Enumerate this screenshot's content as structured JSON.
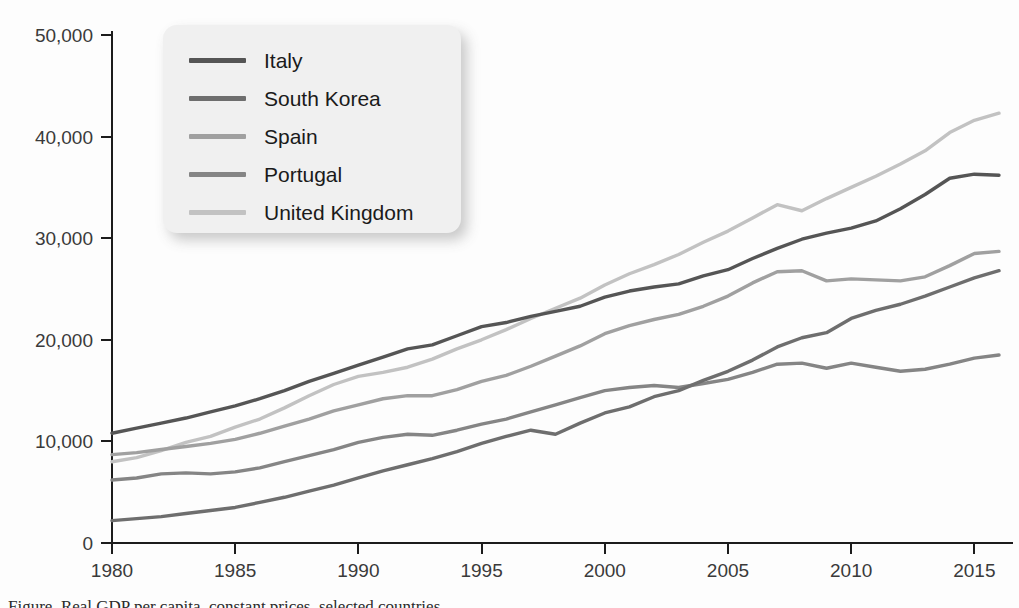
{
  "chart_data": {
    "type": "line",
    "title": "",
    "subtitle": "",
    "xlabel": "",
    "ylabel": "",
    "xlim": [
      1980,
      2016
    ],
    "ylim": [
      0,
      50000
    ],
    "grid": false,
    "legend_position": "top-left",
    "x_ticks": [
      "1980",
      "1985",
      "1990",
      "1995",
      "2000",
      "2005",
      "2010",
      "2015"
    ],
    "x_tick_values": [
      1980,
      1985,
      1990,
      1995,
      2000,
      2005,
      2010,
      2015
    ],
    "y_ticks": [
      "0",
      "10,000",
      "20,000",
      "30,000",
      "40,000",
      "50,000"
    ],
    "y_tick_values": [
      0,
      10000,
      20000,
      30000,
      40000,
      50000
    ],
    "x": [
      1980,
      1981,
      1982,
      1983,
      1984,
      1985,
      1986,
      1987,
      1988,
      1989,
      1990,
      1991,
      1992,
      1993,
      1994,
      1995,
      1996,
      1997,
      1998,
      1999,
      2000,
      2001,
      2002,
      2003,
      2004,
      2005,
      2006,
      2007,
      2008,
      2009,
      2010,
      2011,
      2012,
      2013,
      2014,
      2015,
      2016
    ],
    "series": [
      {
        "name": "Italy",
        "color": "#555555",
        "values": [
          10800,
          11300,
          11800,
          12300,
          12900,
          13500,
          14200,
          15000,
          15900,
          16700,
          17500,
          18300,
          19100,
          19500,
          20400,
          21300,
          21700,
          22300,
          22800,
          23300,
          24200,
          24800,
          25200,
          25500,
          26300,
          26900,
          28000,
          29000,
          29900,
          30500,
          31000,
          31700,
          32900,
          34300,
          35900,
          36300,
          36200
        ]
      },
      {
        "name": "South Korea",
        "color": "#6e6e6e",
        "values": [
          2200,
          2400,
          2600,
          2900,
          3200,
          3500,
          4000,
          4500,
          5100,
          5700,
          6400,
          7100,
          7700,
          8300,
          9000,
          9800,
          10500,
          11100,
          10700,
          11800,
          12800,
          13400,
          14400,
          15000,
          16000,
          16900,
          18000,
          19300,
          20200,
          20700,
          22100,
          22900,
          23500,
          24300,
          25200,
          26100,
          26800
        ]
      },
      {
        "name": "Spain",
        "color": "#a0a0a0",
        "values": [
          8700,
          8900,
          9200,
          9500,
          9800,
          10200,
          10800,
          11500,
          12200,
          13000,
          13600,
          14200,
          14500,
          14500,
          15100,
          15900,
          16500,
          17400,
          18400,
          19400,
          20600,
          21400,
          22000,
          22500,
          23300,
          24300,
          25600,
          26700,
          26800,
          25800,
          26000,
          25900,
          25800,
          26200,
          27300,
          28500,
          28700
        ]
      },
      {
        "name": "Portugal",
        "color": "#858585",
        "values": [
          6200,
          6400,
          6800,
          6900,
          6800,
          7000,
          7400,
          8000,
          8600,
          9200,
          9900,
          10400,
          10700,
          10600,
          11100,
          11700,
          12200,
          12900,
          13600,
          14300,
          15000,
          15300,
          15500,
          15300,
          15700,
          16100,
          16800,
          17600,
          17700,
          17200,
          17700,
          17300,
          16900,
          17100,
          17600,
          18200,
          18500
        ]
      },
      {
        "name": "United Kingdom",
        "color": "#c2c2c2",
        "values": [
          8000,
          8400,
          9100,
          9900,
          10500,
          11400,
          12200,
          13300,
          14500,
          15600,
          16400,
          16800,
          17300,
          18100,
          19100,
          20000,
          21000,
          22100,
          23100,
          24100,
          25400,
          26500,
          27400,
          28400,
          29600,
          30700,
          32000,
          33300,
          32700,
          33900,
          35000,
          36100,
          37300,
          38600,
          40400,
          41600,
          42300
        ]
      }
    ]
  },
  "legend": {
    "entries": [
      {
        "label": "Italy",
        "color": "#555555"
      },
      {
        "label": "South Korea",
        "color": "#6e6e6e"
      },
      {
        "label": "Spain",
        "color": "#a0a0a0"
      },
      {
        "label": "Portugal",
        "color": "#858585"
      },
      {
        "label": "United Kingdom",
        "color": "#c2c2c2"
      }
    ]
  },
  "caption": {
    "partial_text": "Figure. Real GDP per capita, constant prices, selected countries"
  }
}
